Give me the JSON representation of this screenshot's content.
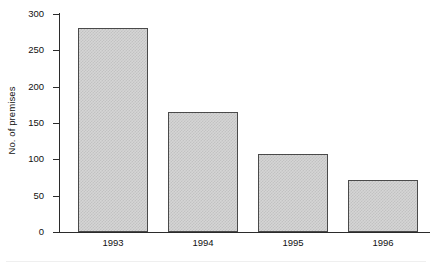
{
  "chart_data": {
    "type": "bar",
    "title": "",
    "subtitle": "",
    "xlabel": "",
    "ylabel": "No. of premises",
    "categories": [
      "1993",
      "1994",
      "1995",
      "1996"
    ],
    "values": [
      281,
      165,
      107,
      72
    ],
    "series": [
      {
        "name": "No. of premises",
        "values": [
          281,
          165,
          107,
          72
        ]
      }
    ],
    "ylim": [
      0,
      300
    ],
    "y_ticks": [
      0,
      50,
      100,
      150,
      200,
      250,
      300
    ],
    "y_tick_labels": [
      "0",
      "50",
      "100",
      "150",
      "200",
      "250",
      "300"
    ],
    "x_tick_labels": [
      "1993",
      "1994",
      "1995",
      "1996"
    ],
    "grid": false,
    "legend": false,
    "legend_position": "none",
    "annotations": [],
    "bar_fill_color": "#d5d5d5",
    "bar_edge_color": "#4a4a4a",
    "axis_color": "#2b2b2b",
    "background_color": "#ffffff"
  }
}
